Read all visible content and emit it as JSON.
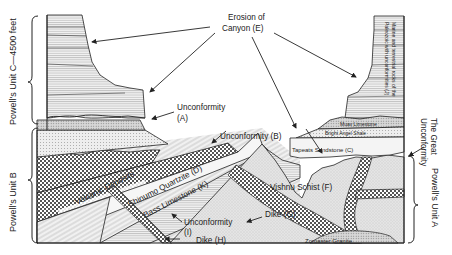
{
  "diagram": {
    "left_brackets": [
      {
        "label": "Powell's Unit C—4500 feet"
      },
      {
        "label": "Powell's Unit B"
      }
    ],
    "right_brackets": [
      {
        "label": "Powell's Unit A"
      }
    ],
    "annotations": {
      "erosion": "Erosion of\nCanyon (E)",
      "erosion_line1": "Erosion of",
      "erosion_line2": "Canyon (E)",
      "unconformity_a_line1": "Unconformity",
      "unconformity_a_line2": "(A)",
      "unconformity_b": "Unconformity (B)",
      "great_unconformity_line1": "The Great",
      "great_unconformity_line2": "Unconformity",
      "unconformity_i_line1": "Unconformity",
      "unconformity_i_line2": "(I)",
      "dike_h": "Dike (H)",
      "dike_g": "Dike (G)",
      "paleozoic_line1": "Marine and terrestrial rocks of the",
      "paleozoic_line2": "Paleozoic with unconformities (J)"
    },
    "layers": {
      "muav": "Muav Limestone",
      "bright_angel": "Bright Angel Shale",
      "tapeats": "Tapeats Sandstone (C)",
      "volcanic": "Volcanic Deposits",
      "shinumo": "Shinumo Quartzite (D)",
      "bass": "Bass Limestone (K)",
      "vishnu": "Vishnu Schist (F)",
      "zoroaster": "Zoroaster Granite"
    },
    "colors": {
      "outline": "#222222",
      "fill_light": "#efefef",
      "fill_mid": "#d9d9d9",
      "fill_dark": "#9a9a9a"
    }
  }
}
